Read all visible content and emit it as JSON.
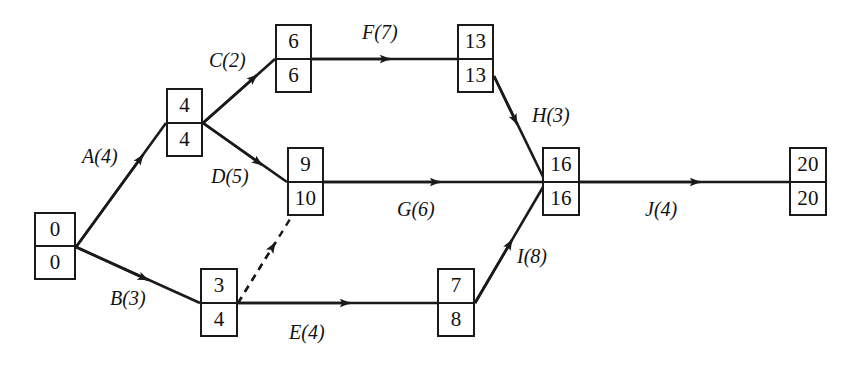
{
  "diagram": {
    "type": "project-network",
    "stroke_color": "#1a1a1a",
    "background_color": "#ffffff",
    "nodes": [
      {
        "id": "start",
        "early": "0",
        "late": "0",
        "x": 34,
        "y": 212
      },
      {
        "id": "n2",
        "early": "4",
        "late": "4",
        "x": 166,
        "y": 88
      },
      {
        "id": "n3",
        "early": "6",
        "late": "6",
        "x": 275,
        "y": 24
      },
      {
        "id": "n4",
        "early": "9",
        "late": "10",
        "x": 287,
        "y": 147
      },
      {
        "id": "n5",
        "early": "3",
        "late": "4",
        "x": 200,
        "y": 268
      },
      {
        "id": "n6",
        "early": "13",
        "late": "13",
        "x": 457,
        "y": 24
      },
      {
        "id": "n7",
        "early": "7",
        "late": "8",
        "x": 437,
        "y": 268
      },
      {
        "id": "n8",
        "early": "16",
        "late": "16",
        "x": 542,
        "y": 147
      },
      {
        "id": "end",
        "early": "20",
        "late": "20",
        "x": 789,
        "y": 147
      }
    ],
    "edges": [
      {
        "id": "A",
        "label": "A(4)",
        "label_x": 82,
        "label_y": 146,
        "style": "solid",
        "from": "start",
        "to": "n2"
      },
      {
        "id": "B",
        "label": "B(3)",
        "label_x": 110,
        "label_y": 288,
        "style": "solid",
        "from": "start",
        "to": "n5"
      },
      {
        "id": "C",
        "label": "C(2)",
        "label_x": 209,
        "label_y": 50,
        "style": "solid",
        "from": "n2",
        "to": "n3"
      },
      {
        "id": "D",
        "label": "D(5)",
        "label_x": 211,
        "label_y": 166,
        "style": "solid",
        "from": "n2",
        "to": "n4"
      },
      {
        "id": "E",
        "label": "E(4)",
        "label_x": 289,
        "label_y": 322,
        "style": "solid",
        "from": "n5",
        "to": "n7"
      },
      {
        "id": "F",
        "label": "F(7)",
        "label_x": 362,
        "label_y": 22,
        "style": "solid",
        "from": "n3",
        "to": "n6"
      },
      {
        "id": "G",
        "label": "G(6)",
        "label_x": 397,
        "label_y": 199,
        "style": "solid",
        "from": "n4",
        "to": "n8"
      },
      {
        "id": "H",
        "label": "H(3)",
        "label_x": 532,
        "label_y": 105,
        "style": "solid",
        "from": "n6",
        "to": "n8"
      },
      {
        "id": "I",
        "label": "I(8)",
        "label_x": 517,
        "label_y": 246,
        "style": "solid",
        "from": "n7",
        "to": "n8"
      },
      {
        "id": "J",
        "label": "J(4)",
        "label_x": 645,
        "label_y": 199,
        "style": "solid",
        "from": "n8",
        "to": "end"
      },
      {
        "id": "dummy",
        "label": "",
        "label_x": 0,
        "label_y": 0,
        "style": "dashed",
        "from": "n5",
        "to": "n4"
      }
    ]
  }
}
